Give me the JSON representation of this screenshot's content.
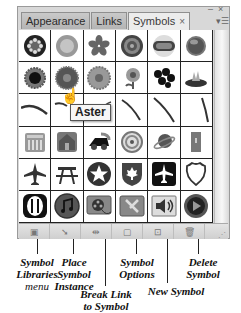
{
  "panel": {
    "tabs": [
      {
        "label": "Appearance",
        "active": false
      },
      {
        "label": "Links",
        "active": false
      },
      {
        "label": "Symbols",
        "active": true,
        "close_glyph": "×"
      }
    ],
    "controls": {
      "minimize_glyph": "–",
      "close_glyph": "×",
      "menu_glyph": "▾☰"
    },
    "symbols": [
      [
        "dark-rosette",
        "orange-bowl",
        "blue-flower",
        "target-ring",
        "pill-badge",
        "blue-sphere"
      ],
      [
        "black-flower",
        "aster",
        "daisy",
        "stem-flower",
        "berry-cluster",
        "water-lily"
      ],
      [
        "stroke-1",
        "stroke-2",
        "stroke-3",
        "stroke-4",
        "stroke-5",
        "stroke-6"
      ],
      [
        "building-icon",
        "house-icon",
        "truck-icon",
        "compass-icon",
        "planet-icon",
        "door-icon"
      ],
      [
        "airplane",
        "picnic-table",
        "star-circle",
        "maple-leaf-shield",
        "airplane-square",
        "highway-shield"
      ],
      [
        "restaurant",
        "music-note",
        "film-reel",
        "tools",
        "speaker",
        "play-button"
      ]
    ],
    "tooltip": "Aster",
    "toolbar": [
      {
        "name": "symbol-libraries-menu-button",
        "glyph": "▣"
      },
      {
        "name": "place-symbol-instance-button",
        "glyph": "➘"
      },
      {
        "name": "break-link-button",
        "glyph": "⇹"
      },
      {
        "name": "symbol-options-button",
        "glyph": "▢"
      },
      {
        "name": "new-symbol-button",
        "glyph": "⊡"
      },
      {
        "name": "delete-symbol-button",
        "glyph": "🗑"
      }
    ]
  },
  "callouts": {
    "libraries": {
      "line1": "Symbol",
      "line2": "Libraries",
      "line3": "menu"
    },
    "place": {
      "line1": "Place",
      "line2": "Symbol",
      "line3": "Instance"
    },
    "break": {
      "line1": "Break Link",
      "line2": "to Symbol"
    },
    "options": {
      "line1": "Symbol",
      "line2": "Options"
    },
    "new": {
      "line1": "New Symbol"
    },
    "delete": {
      "line1": "Delete",
      "line2": "Symbol"
    }
  }
}
